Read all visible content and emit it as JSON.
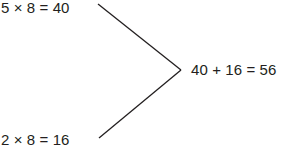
{
  "diagram": {
    "equations": {
      "top": "5 × 8 = 40",
      "bottom": "2 × 8 = 16",
      "result": "40 + 16 = 56"
    },
    "connector": {
      "type": "chevron-lines",
      "color": "#231f20"
    }
  }
}
